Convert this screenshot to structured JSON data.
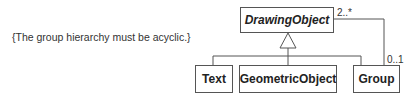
{
  "diagram": {
    "type": "uml-class",
    "constraint": "{The group hierarchy must be acyclic.}",
    "classes": [
      {
        "id": "drawing-object",
        "name": "DrawingObject",
        "abstract": true
      },
      {
        "id": "text",
        "name": "Text",
        "abstract": false
      },
      {
        "id": "geometric-object",
        "name": "GeometricObject",
        "abstract": false
      },
      {
        "id": "group",
        "name": "Group",
        "abstract": false
      }
    ],
    "generalization": {
      "parent": "DrawingObject",
      "children": [
        "Text",
        "GeometricObject",
        "Group"
      ]
    },
    "association": {
      "from": "Group",
      "to": "DrawingObject",
      "multiplicity_drawing_object_end": "2..*",
      "multiplicity_group_end": "0..1"
    }
  }
}
